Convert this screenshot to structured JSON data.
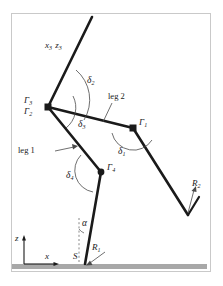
{
  "figure": {
    "type": "kinematic-diagram",
    "background_color": "#ffffff",
    "line_color": "#1a1a1a",
    "ground_color": "#a8a8a8",
    "frame_color": "#c9c9c9"
  },
  "labels": {
    "axis_frame": {
      "text": "x",
      "sub": "3",
      "text2": "z",
      "sub2": "3",
      "full": "x3 z3"
    },
    "gamma3": {
      "text": "Γ",
      "sub": "3"
    },
    "gamma2": {
      "text": "Γ",
      "sub": "2"
    },
    "gamma1": {
      "text": "Γ",
      "sub": "1"
    },
    "gamma4": {
      "text": "Γ",
      "sub": "4"
    },
    "delta1": {
      "text": "δ",
      "sub": "1"
    },
    "delta2": {
      "text": "δ",
      "sub": "2"
    },
    "delta3": {
      "text": "δ",
      "sub": "3"
    },
    "delta4": {
      "text": "δ",
      "sub": "4"
    },
    "alpha": {
      "text": "α"
    },
    "leg1": {
      "text": "leg 1"
    },
    "leg2": {
      "text": "leg 2"
    },
    "reaction1": {
      "text": "R",
      "sub": "1"
    },
    "reaction2": {
      "text": "R",
      "sub": "2"
    },
    "contact_point": {
      "text": "S"
    },
    "axis_x": {
      "text": "x"
    },
    "axis_z": {
      "text": "z"
    }
  },
  "geometry": {
    "frame": {
      "x": 11,
      "y": 13,
      "w": 200,
      "h": 259
    },
    "ground_bar": {
      "x": 12,
      "y": 264,
      "w": 195,
      "h": 5
    },
    "joints": {
      "gamma23": {
        "x": 48,
        "y": 107
      },
      "gamma1": {
        "x": 133,
        "y": 128
      },
      "gamma4": {
        "x": 101,
        "y": 172
      },
      "contact_S": {
        "x": 85,
        "y": 264
      },
      "top_end": {
        "x": 92,
        "y": 17
      },
      "foot2_vertex": {
        "x": 188,
        "y": 215
      },
      "foot2_tip": {
        "x": 198,
        "y": 198
      }
    }
  }
}
